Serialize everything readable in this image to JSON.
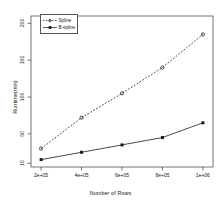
{
  "chart_data": {
    "type": "line",
    "title": "",
    "xlabel": "Number of Rows",
    "ylabel": "Runtime(min)",
    "x": [
      200000,
      400000,
      600000,
      800000,
      1000000
    ],
    "xtick_labels": [
      "2e+05",
      "4e+05",
      "6e+05",
      "8e+05",
      "1e+06"
    ],
    "ytick_labels": [
      "10",
      "50",
      "100",
      "150",
      "200"
    ],
    "ytick_values": [
      10,
      50,
      100,
      150,
      200
    ],
    "xlim": [
      150000,
      1050000
    ],
    "ylim": [
      5,
      210
    ],
    "grid": false,
    "legend_position": "top-left",
    "series": [
      {
        "name": "Spline",
        "values": [
          30,
          72,
          105,
          140,
          185
        ],
        "line_style": "dashed",
        "marker": "circle",
        "color": "#1a1a1a"
      },
      {
        "name": "B-spline",
        "values": [
          15,
          25,
          35,
          45,
          65
        ],
        "line_style": "solid",
        "marker": "square",
        "color": "#1a1a1a"
      }
    ]
  },
  "legend": {
    "entries": [
      {
        "label": "Spline"
      },
      {
        "label": "B-spline"
      }
    ]
  },
  "axes": {
    "x_title": "Number of Rows",
    "y_title": "Runtime(min)",
    "x_ticks": [
      "2e+05",
      "4e+05",
      "6e+05",
      "8e+05",
      "1e+06"
    ],
    "y_ticks": [
      "10",
      "50",
      "100",
      "150",
      "200"
    ]
  },
  "colors": {
    "axis": "#1a1a1a",
    "series1": "#1a1a1a",
    "series2": "#1a1a1a",
    "background": "#ffffff"
  }
}
